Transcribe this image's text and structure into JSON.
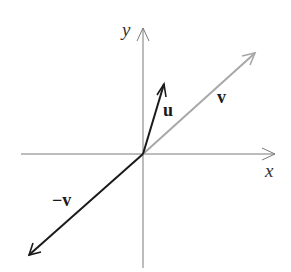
{
  "diagram": {
    "type": "vector-diagram",
    "axes": {
      "x_label": "x",
      "y_label": "y",
      "axis_color": "#7a7a7a"
    },
    "vectors": [
      {
        "name": "u",
        "label": "u",
        "color": "#1a1a1a",
        "from": [
          143,
          154
        ],
        "to": [
          164,
          84
        ]
      },
      {
        "name": "v",
        "label": "v",
        "color": "#a8a8a8",
        "from": [
          143,
          154
        ],
        "to": [
          255,
          53
        ]
      },
      {
        "name": "neg-v",
        "label": "−v",
        "color": "#1a1a1a",
        "from": [
          143,
          154
        ],
        "to": [
          29,
          255
        ]
      }
    ]
  }
}
